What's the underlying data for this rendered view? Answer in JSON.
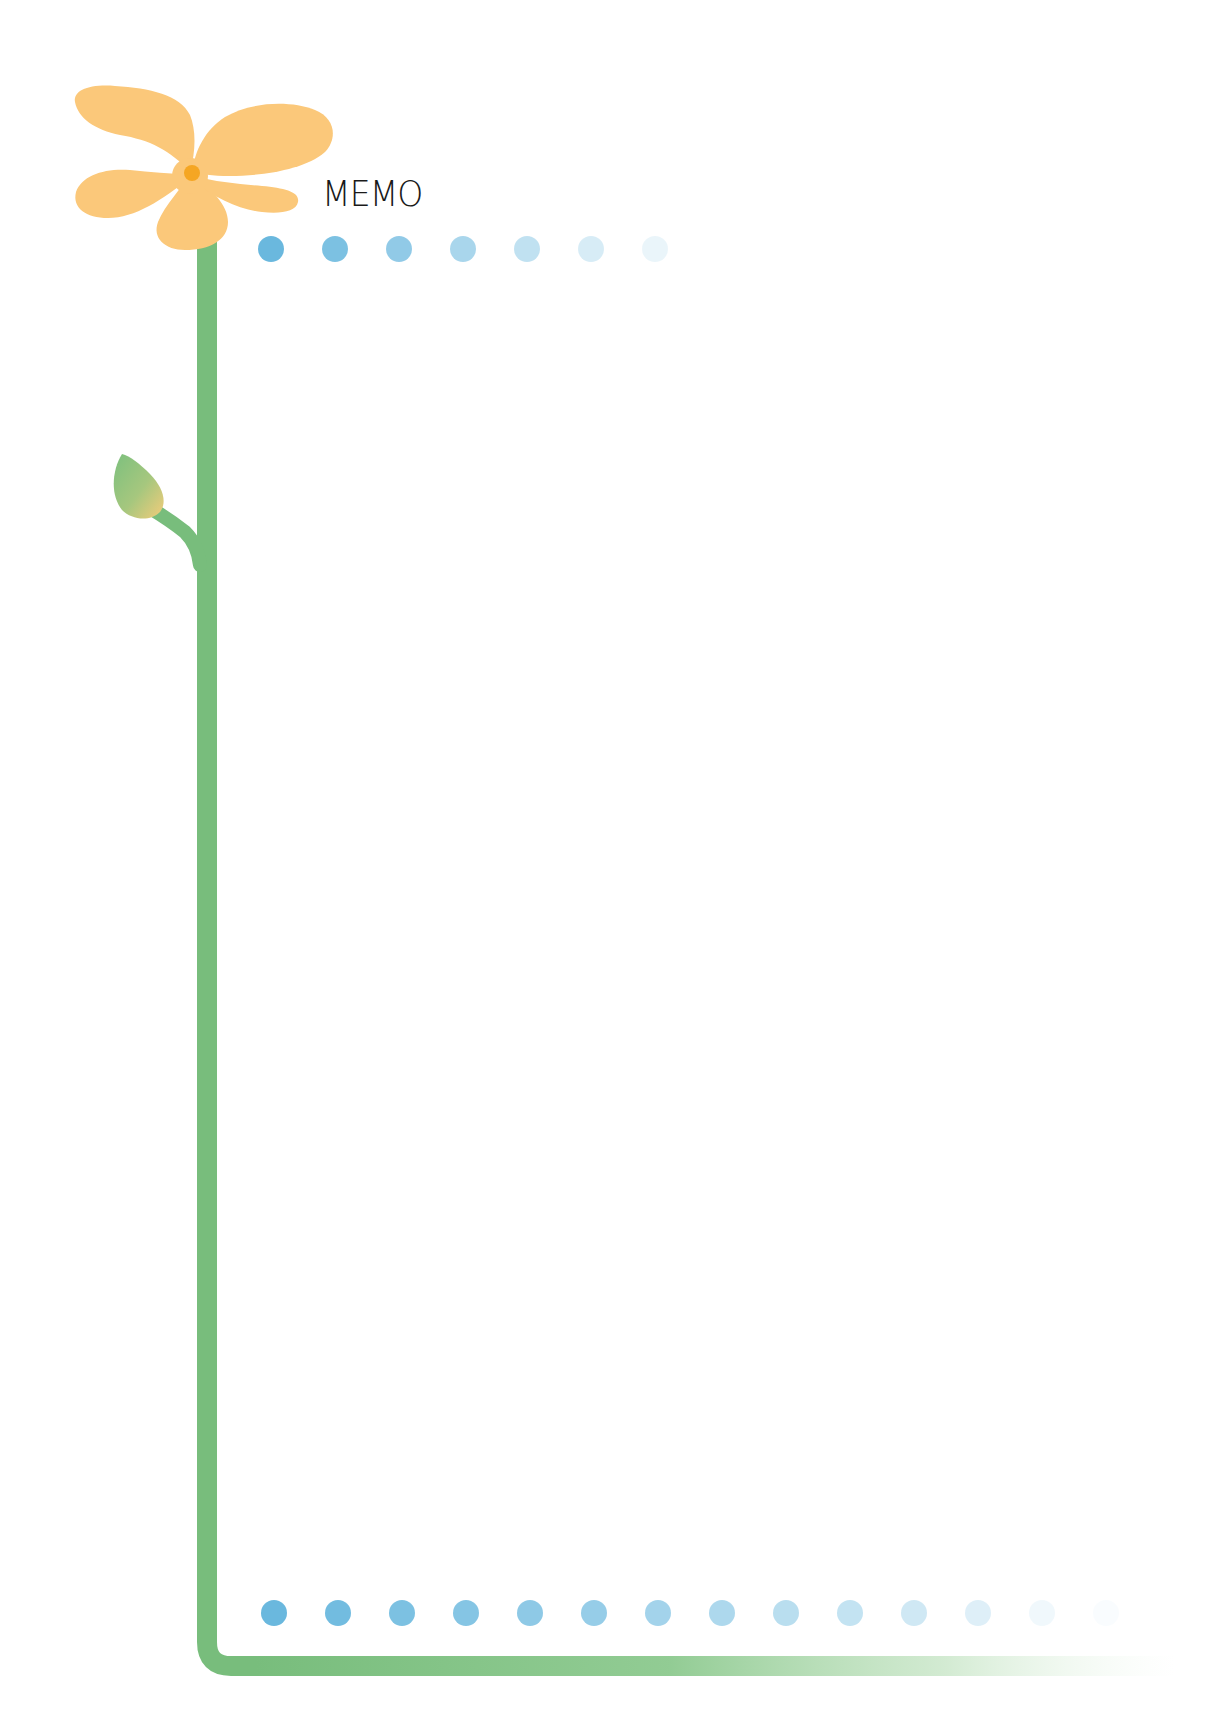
{
  "memo": {
    "title": "MEMO"
  },
  "colors": {
    "petal": "#fbc87a",
    "flower_center": "#f5a623",
    "stem": "#78bd7c",
    "bud_start": "#7cc07e",
    "bud_end": "#f3cc7a",
    "dot_base": "#6ab8de"
  },
  "decor": {
    "top_dots": {
      "count": 7,
      "start_x": 258,
      "spacing": 64,
      "y": 236,
      "opacities": [
        1.0,
        0.88,
        0.74,
        0.58,
        0.42,
        0.27,
        0.14
      ]
    },
    "bottom_dots": {
      "count": 14,
      "start_x": 261,
      "spacing": 64,
      "y": 1600,
      "opacities": [
        1.0,
        0.95,
        0.88,
        0.82,
        0.76,
        0.7,
        0.62,
        0.55,
        0.47,
        0.4,
        0.32,
        0.22,
        0.1,
        0.04
      ]
    }
  }
}
